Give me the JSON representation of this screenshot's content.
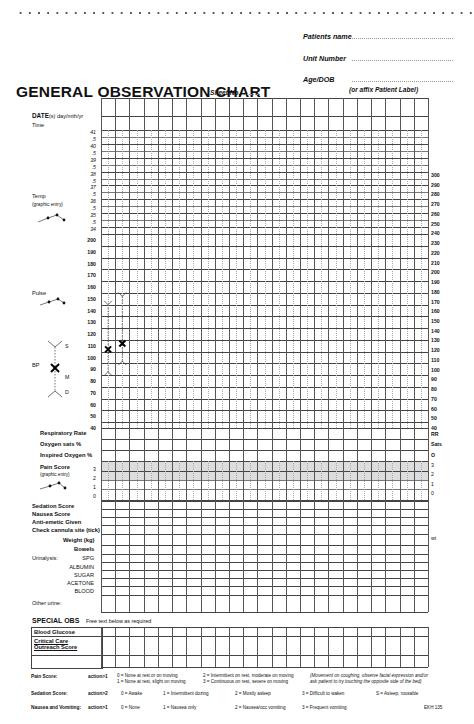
{
  "header": {
    "cut_text": "ADMISSION FORM AREA",
    "patient_fields": [
      {
        "label": "Patients name",
        "value": ""
      },
      {
        "label": "Unit Number",
        "value": ""
      },
      {
        "label": "Age/DOB",
        "value": ""
      }
    ],
    "title": "GENERAL OBSERVATION CHART",
    "sheet_label": "Sheet No.",
    "affix_label": "(or affix Patient Label)"
  },
  "chart": {
    "columns": 23,
    "date_label": "DATE",
    "date_suffix": "(s) day/mth/yr",
    "time_label": "Time",
    "temp_label": "Temp",
    "temp_sub": "(graphic entry)",
    "temp_ticks": [
      "41",
      ".5",
      "40",
      ".5",
      "39",
      ".5",
      "38",
      ".5",
      "37",
      ".5",
      "36",
      ".5",
      "35",
      ".5",
      "34"
    ],
    "pulse_label": "Pulse",
    "pulse_ticks": [
      "200",
      "190",
      "180",
      "170",
      "160",
      "150",
      "140",
      "130",
      "120",
      "110",
      "100",
      "90",
      "80",
      "70",
      "60",
      "50",
      "40"
    ],
    "bp_label": "BP",
    "bp_s": "S",
    "bp_m": "M",
    "bp_d": "D",
    "right_ticks": [
      "300",
      "290",
      "280",
      "270",
      "260",
      "250",
      "240",
      "230",
      "220",
      "210",
      "200",
      "190",
      "180",
      "170",
      "160",
      "150",
      "140",
      "130",
      "120",
      "110",
      "100",
      "90",
      "80",
      "70",
      "60",
      "50",
      "40"
    ],
    "bp_readings": [
      {
        "column": 1,
        "systolic": 145,
        "mean": 107,
        "diastolic": 88
      },
      {
        "column": 2,
        "systolic": 152,
        "mean": 112,
        "diastolic": 97
      }
    ]
  },
  "rows": {
    "resp_rate": "Respiratory Rate",
    "oxygen_sats": "Oxygen sats %",
    "inspired_oxygen": "Inspired Oxygen %",
    "pain_score": "Pain Score",
    "pain_sub": "(graphic entry)",
    "pain_ticks": [
      "3",
      "2",
      "1",
      "0"
    ],
    "right_rr": "RR",
    "right_sats": "Sats",
    "right_o": "O",
    "right_pain": [
      "3",
      "2",
      "1",
      "0"
    ],
    "sedation": "Sedation Score",
    "nausea": "Nausea Score",
    "antiemetic": "Anti-emetic Given",
    "cannula": "Check cannula site (tick)",
    "weight": "Weight (kg)",
    "weight_right": "wt",
    "bowels": "Bowels",
    "urinalysis": "Urinalysis:",
    "urine_items": [
      "SPG",
      "ALBUMIN",
      "SUGAR",
      "ACETONE",
      "BLOOD"
    ],
    "other_urine": "Other urine:"
  },
  "special_obs": {
    "title": "SPECIAL OBS",
    "sub": "Free text below as required",
    "rows": [
      "Blood Glucose",
      "Critical Care Outreach Score",
      ""
    ]
  },
  "legend": {
    "pain": {
      "label": "Pain Score:",
      "action": "action>1",
      "items": [
        "0 = None at rest or on moving",
        "1 = None at rest, slight on moving",
        "2 = Intermittent on rest, moderate on moving",
        "3 = Continuous on rest, severe on moving"
      ],
      "note1": "(Movement on coughing, observe facial expression and/or",
      "note2": "ask patient to try touching the opposite side of the bed)"
    },
    "sedation": {
      "label": "Sedation Score:",
      "action": "action>2",
      "items": [
        "0 = Awake",
        "1 = Intermittent dozing",
        "2 = Mostly asleep",
        "3 = Difficult to waken",
        "S = Asleep, rousable"
      ]
    },
    "nausea": {
      "label": "Nausea and Vomiting:",
      "action": "action>1",
      "items": [
        "0 = None",
        "1 = Nausea only",
        "2 = Nausea/occ vomiting",
        "3 = Frequent vomiting"
      ]
    },
    "form_code": "EKH 135"
  }
}
